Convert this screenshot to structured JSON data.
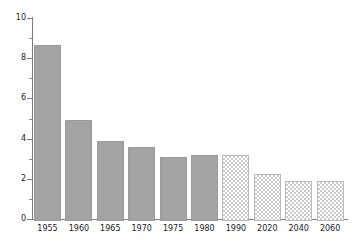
{
  "chart_data": {
    "type": "bar",
    "title": "",
    "subtitle": "",
    "xlabel": "",
    "ylabel": "",
    "categories": [
      "1955",
      "1960",
      "1965",
      "1970",
      "1975",
      "1980",
      "1990",
      "2020",
      "2040",
      "2060"
    ],
    "values": [
      8.75,
      5.05,
      4.0,
      3.7,
      3.2,
      3.3,
      3.3,
      2.35,
      2.0,
      2.0
    ],
    "series": [
      {
        "name": "",
        "values": [
          8.75,
          5.05,
          4.0,
          3.7,
          3.2,
          3.3,
          3.3,
          2.35,
          2.0,
          2.0
        ],
        "styles": [
          "solid",
          "solid",
          "solid",
          "solid",
          "solid",
          "solid",
          "hatched",
          "hatched",
          "hatched",
          "hatched"
        ]
      }
    ],
    "ylim": [
      0,
      10
    ],
    "xlim_note": "categorical",
    "yticks": [
      0,
      2,
      4,
      6,
      8,
      10
    ],
    "ytick_labels": [
      "0",
      "2",
      "4",
      "6",
      "8",
      "10"
    ],
    "yminor_ticks": [
      1,
      3,
      5,
      7,
      9
    ],
    "grid": false,
    "legend": null,
    "legend_position": "none",
    "annotations": [],
    "colors": {
      "solid_bar": "#a3a3a3",
      "solid_bar_edge": "#9a9a9a",
      "hatched_bar_fill": "#ffffff",
      "hatched_bar_pattern": "#cccccc",
      "hatched_bar_edge": "#b9b9b9",
      "axis": "#7d7d7d",
      "text": "#1a1a1a",
      "background": "#ffffff"
    }
  }
}
